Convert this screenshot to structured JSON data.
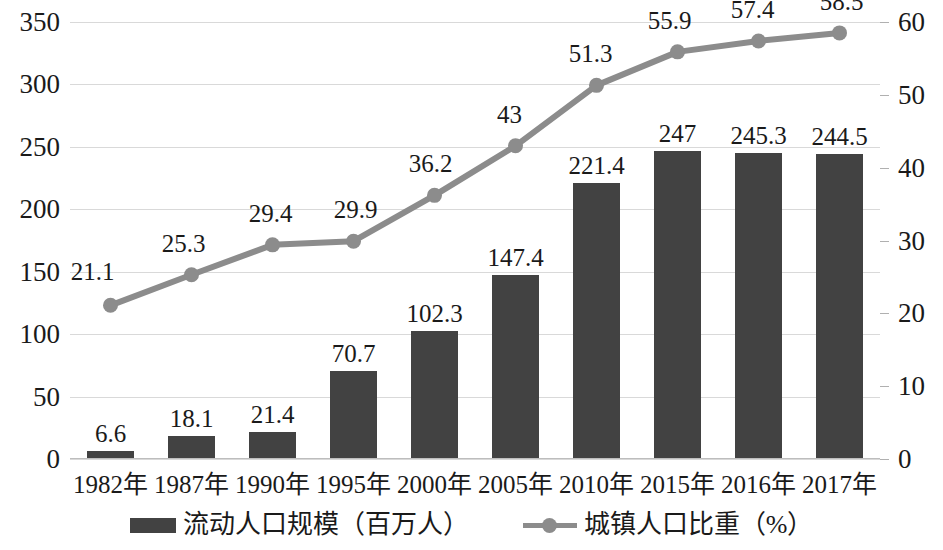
{
  "chart_data": {
    "type": "bar",
    "title": "",
    "subtitle": "",
    "xlabel": "",
    "ylabel": "",
    "y2label": "",
    "grid": true,
    "legend_position": "bottom",
    "categories": [
      "1982年",
      "1987年",
      "1990年",
      "1995年",
      "2000年",
      "2005年",
      "2010年",
      "2015年",
      "2016年",
      "2017年"
    ],
    "ylim": [
      0,
      350
    ],
    "yticks": [
      0,
      50,
      100,
      150,
      200,
      250,
      300,
      350
    ],
    "y2lim": [
      0,
      60
    ],
    "y2ticks": [
      0,
      10,
      20,
      30,
      40,
      50,
      60
    ],
    "series": [
      {
        "name": "流动人口规模（百万人）",
        "type": "bar",
        "axis": "left",
        "color": "#424242",
        "values": [
          6.6,
          18.1,
          21.4,
          70.7,
          102.3,
          147.4,
          221.4,
          247,
          245.3,
          244.5
        ],
        "labels": [
          "6.6",
          "18.1",
          "21.4",
          "70.7",
          "102.3",
          "147.4",
          "221.4",
          "247",
          "245.3",
          "244.5"
        ]
      },
      {
        "name": "城镇人口比重（%）",
        "type": "line",
        "axis": "right",
        "color": "#8c8c8c",
        "values": [
          21.1,
          25.3,
          29.4,
          29.9,
          36.2,
          43,
          51.3,
          55.9,
          57.4,
          58.5
        ],
        "labels": [
          "21.1",
          "25.3",
          "29.4",
          "29.9",
          "36.2",
          "43",
          "51.3",
          "55.9",
          "57.4",
          "58.5"
        ]
      }
    ]
  },
  "legend": {
    "items": [
      {
        "label": "流动人口规模（百万人）",
        "marker": "bar-swatch"
      },
      {
        "label": "城镇人口比重（%）",
        "marker": "line-marker-swatch"
      }
    ]
  }
}
